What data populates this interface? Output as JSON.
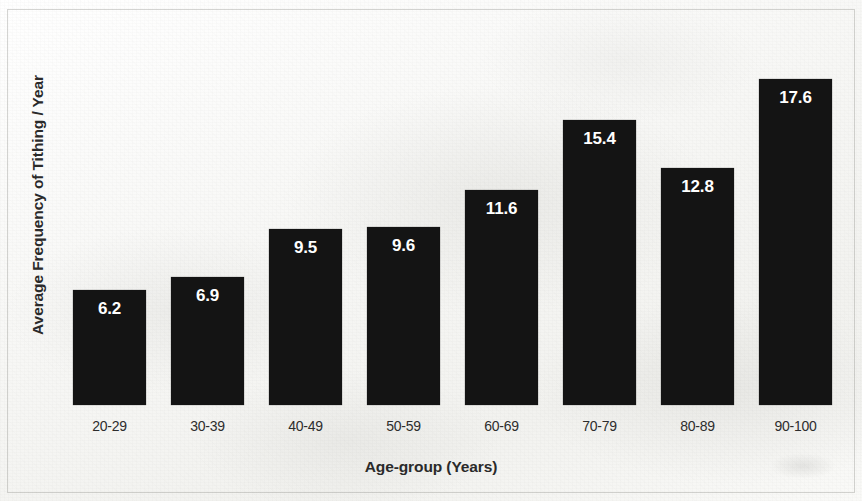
{
  "chart_data": {
    "type": "bar",
    "title": "",
    "subtitle": "",
    "xlabel": "Age-group (Years)",
    "ylabel": "Average Frequency of Tithing / Year",
    "categories": [
      "20-29",
      "30-39",
      "40-49",
      "50-59",
      "60-69",
      "70-79",
      "80-89",
      "90-100"
    ],
    "values": [
      6.2,
      6.9,
      9.5,
      9.6,
      11.6,
      15.4,
      12.8,
      17.6
    ],
    "value_labels": [
      "6.2",
      "6.9",
      "9.5",
      "9.6",
      "11.6",
      "15.4",
      "12.8",
      "17.6"
    ],
    "ylim": [
      0,
      20.8
    ],
    "grid": false,
    "legend": null,
    "y_tick_labels": [],
    "bar_color": "#141414",
    "value_label_color": "#ffffff",
    "axis_title_color": "#2a2a2a",
    "background_color": "#fbfbfa"
  }
}
